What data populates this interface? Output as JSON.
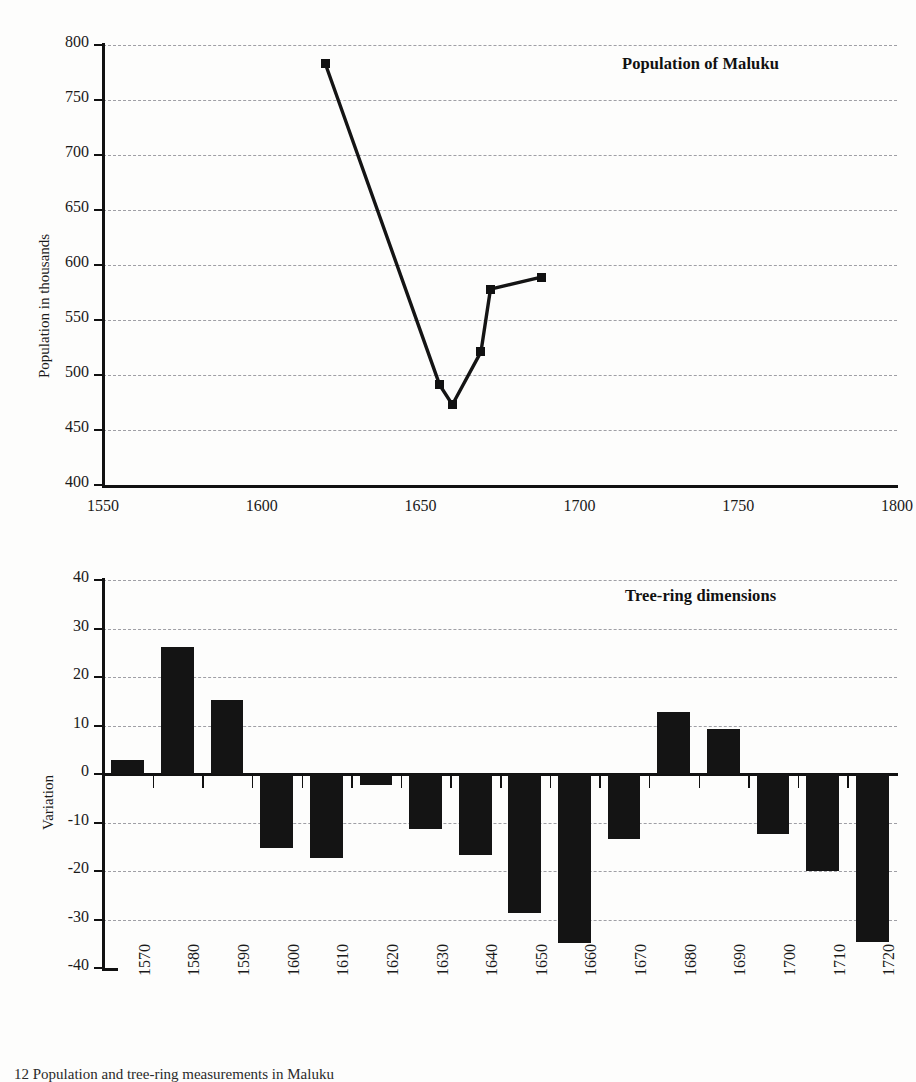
{
  "page": {
    "background_color": "#fdfdfc",
    "ink_color": "#141414",
    "grid_color": "#8f8f96"
  },
  "caption": {
    "text": "12  Population and tree-ring measurements in Maluku"
  },
  "chart_data": [
    {
      "id": "population-of-maluku",
      "type": "line",
      "title": "Population of Maluku",
      "xlabel": "",
      "ylabel": "Population in thousands",
      "xlim": [
        1550,
        1800
      ],
      "ylim": [
        400,
        800
      ],
      "xticks": [
        1550,
        1600,
        1650,
        1700,
        1750,
        1800
      ],
      "xtick_labels": [
        "1550",
        "1600",
        "1650",
        "1700",
        "1750",
        "1800"
      ],
      "yticks": [
        400,
        450,
        500,
        550,
        600,
        650,
        700,
        750,
        800
      ],
      "ytick_labels": [
        "400",
        "450",
        "500",
        "550",
        "600",
        "650",
        "700",
        "750",
        "800"
      ],
      "grid": "horizontal-dashed",
      "legend": "none",
      "marker": "filled-square",
      "x": [
        1620,
        1656,
        1660,
        1669,
        1672,
        1688
      ],
      "values": [
        783,
        491,
        473,
        521,
        578,
        589
      ],
      "points": [
        {
          "x": 1620,
          "y": 783
        },
        {
          "x": 1656,
          "y": 491
        },
        {
          "x": 1660,
          "y": 473
        },
        {
          "x": 1669,
          "y": 521
        },
        {
          "x": 1672,
          "y": 578
        },
        {
          "x": 1688,
          "y": 589
        }
      ]
    },
    {
      "id": "tree-ring-dimensions",
      "type": "bar",
      "title": "Tree-ring dimensions",
      "xlabel": "",
      "ylabel": "Variation",
      "ylim": [
        -40,
        40
      ],
      "yticks": [
        -40,
        -30,
        -20,
        -10,
        0,
        10,
        20,
        30,
        40
      ],
      "ytick_labels": [
        "-40",
        "-30",
        "-20",
        "-10",
        "0",
        "10",
        "20",
        "30",
        "40"
      ],
      "grid": "horizontal-dashed",
      "legend": "none",
      "categories": [
        "1570",
        "1580",
        "1590",
        "1600",
        "1610",
        "1620",
        "1630",
        "1640",
        "1650",
        "1660",
        "1670",
        "1680",
        "1690",
        "1700",
        "1710",
        "1720"
      ],
      "values": [
        2.8,
        26.2,
        15.2,
        -15.2,
        -17.4,
        -2.3,
        -11.3,
        -16.8,
        -28.6,
        -34.8,
        -13.4,
        12.7,
        9.2,
        -12.4,
        -20.1,
        -34.6
      ]
    }
  ]
}
